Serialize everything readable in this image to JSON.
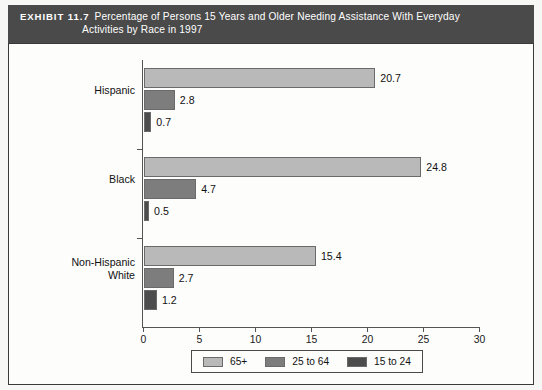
{
  "banner": {
    "exhibit_no": "EXHIBIT 11.7",
    "title_line1": "Percentage of Persons 15 Years and Older Needing Assistance With Everyday",
    "title_line2": "Activities by Race in 1997"
  },
  "legend": {
    "items": [
      {
        "label": "65+",
        "color": "#b9b9b9"
      },
      {
        "label": "25 to 64",
        "color": "#7d7d7d"
      },
      {
        "label": "15 to 24",
        "color": "#4d4d4d"
      }
    ]
  },
  "axis": {
    "ticks": [
      "0",
      "5",
      "10",
      "15",
      "20",
      "25",
      "30"
    ]
  },
  "chart_data": {
    "type": "bar",
    "orientation": "horizontal",
    "title": "Percentage of Persons 15 Years and Older Needing Assistance With Everyday Activities by Race in 1997",
    "xlabel": "",
    "ylabel": "",
    "xlim": [
      0,
      30
    ],
    "xticks": [
      0,
      5,
      10,
      15,
      20,
      25,
      30
    ],
    "grid": false,
    "legend_position": "bottom",
    "categories": [
      "Hispanic",
      "Black",
      "Non-Hispanic White"
    ],
    "series": [
      {
        "name": "65+",
        "color": "#b9b9b9",
        "values": [
          20.7,
          24.8,
          15.4
        ]
      },
      {
        "name": "25 to 64",
        "color": "#7d7d7d",
        "values": [
          2.8,
          4.7,
          2.7
        ]
      },
      {
        "name": "15 to 24",
        "color": "#4d4d4d",
        "values": [
          0.7,
          0.5,
          1.2
        ]
      }
    ],
    "data_labels": {
      "Hispanic": {
        "65+": "20.7",
        "25 to 64": "2.8",
        "15 to 24": "0.7"
      },
      "Black": {
        "65+": "24.8",
        "25 to 64": "4.7",
        "15 to 24": "0.5"
      },
      "Non-Hispanic White": {
        "65+": "15.4",
        "25 to 64": "2.7",
        "15 to 24": "1.2"
      }
    }
  },
  "categories_display": [
    {
      "line1": "Hispanic",
      "line2": ""
    },
    {
      "line1": "Black",
      "line2": ""
    },
    {
      "line1": "Non-Hispanic",
      "line2": "White"
    }
  ]
}
